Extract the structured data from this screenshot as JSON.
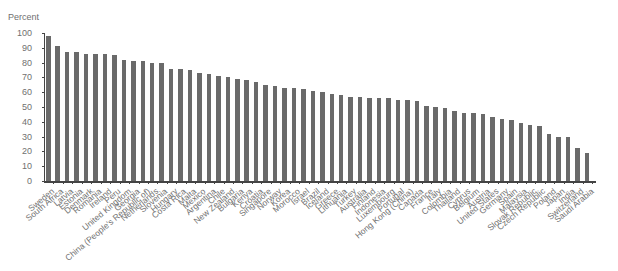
{
  "chart_data": {
    "type": "bar",
    "title": "",
    "ylabel": "Percent",
    "xlabel": "",
    "ylim": [
      0,
      100
    ],
    "yticks": [
      0,
      10,
      20,
      30,
      40,
      50,
      60,
      70,
      80,
      90,
      100
    ],
    "grid": false,
    "legend": null,
    "bar_color": "#6a6a6a",
    "categories": [
      "Sweden",
      "South Africa",
      "Latvia",
      "Estonia",
      "Denmark",
      "Romania",
      "Ireland",
      "Peru",
      "United Kingdom",
      "Georgia",
      "China (People's Republic of)",
      "Netherlands",
      "Slovenia",
      "Hungary",
      "Costa Rica",
      "Malta",
      "Mexico",
      "Argentina",
      "Chile",
      "New Zealand",
      "Bulgaria",
      "Kenya",
      "Croatia",
      "Singapore",
      "Norway",
      "Korea",
      "Morocco",
      "Israel",
      "Brazil",
      "Iceland",
      "Greece",
      "Lithuania",
      "Turkey",
      "Australia",
      "Finland",
      "Indonesia",
      "Luxembourg",
      "Portugal",
      "Hong Kong (China)",
      "Canada",
      "France",
      "Italy",
      "Colombia",
      "Thailand",
      "Cyprus",
      "Belgium",
      "Austria",
      "United States",
      "Germany",
      "Spain",
      "Malaysia",
      "Slovak Republic",
      "Czech Republic",
      "Poland",
      "Japan",
      "India",
      "Switzerland",
      "Saudi Arabia"
    ],
    "values": [
      98,
      91,
      87,
      87,
      86,
      86,
      86,
      85,
      82,
      81,
      81,
      80,
      80,
      76,
      76,
      75,
      73,
      72,
      71,
      70,
      69,
      68,
      67,
      65,
      64,
      63,
      63,
      62,
      61,
      60,
      59,
      58,
      57,
      57,
      56,
      56,
      56,
      55,
      55,
      54,
      51,
      50,
      49,
      47,
      46,
      46,
      45,
      43,
      42,
      41,
      39,
      38,
      37,
      32,
      30,
      30,
      22,
      19
    ]
  }
}
